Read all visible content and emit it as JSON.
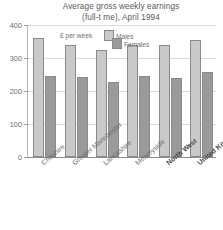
{
  "chart_data": {
    "type": "bar",
    "title": "Average gross weekly earnings",
    "subtitle": "(full-t me), April 1994",
    "units_label": "£ per week",
    "xlabel": "",
    "ylabel": "",
    "ylim": [
      0,
      400
    ],
    "yticks": [
      0,
      100,
      200,
      300,
      400
    ],
    "ytick_labels": [
      "0",
      "100",
      "200",
      "300",
      "400"
    ],
    "grid": true,
    "legend_position": "top-center",
    "categories": [
      "Cheshire",
      "Greater Manchester",
      "Lancashire",
      "Merseyside",
      "North West",
      "United Kingdom"
    ],
    "emphasised_categories": [
      "North West",
      "United Kingdom"
    ],
    "series": [
      {
        "name": "Males",
        "color": "#c9c9c9",
        "values": [
          361,
          340,
          325,
          338,
          338,
          355
        ]
      },
      {
        "name": "Females",
        "color": "#9a9a9a",
        "values": [
          247,
          243,
          228,
          247,
          240,
          258
        ]
      }
    ]
  }
}
